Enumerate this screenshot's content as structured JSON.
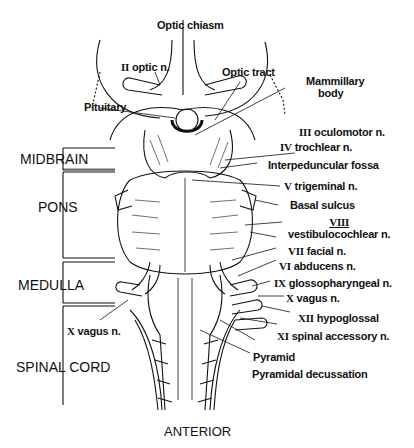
{
  "figure": {
    "orientation_label": "ANTERIOR",
    "regions": [
      {
        "id": "midbrain",
        "label": "MIDBRAIN"
      },
      {
        "id": "pons",
        "label": "PONS"
      },
      {
        "id": "medulla",
        "label": "MEDULLA"
      },
      {
        "id": "spinal_cord",
        "label": "SPINAL CORD"
      }
    ],
    "labels": {
      "optic_chiasm": "Optic chiasm",
      "optic_n": {
        "numeral": "II",
        "text": "optic n."
      },
      "optic_tract": "Optic tract",
      "mammillary_body_1": "Mammillary",
      "mammillary_body_2": "body",
      "pituitary": "Pituitary",
      "oculomotor": {
        "numeral": "III",
        "text": "oculomotor n."
      },
      "trochlear": {
        "numeral": "IV",
        "text": "trochlear n."
      },
      "interpeduncular_fossa": "Interpeduncular fossa",
      "trigeminal": {
        "numeral": "V",
        "text": "trigeminal n."
      },
      "basal_sulcus": "Basal sulcus",
      "vestibulocochlear": {
        "numeral": "VIII",
        "text": "vestibulocochlear n."
      },
      "facial": {
        "numeral": "VII",
        "text": "facial n."
      },
      "abducens": {
        "numeral": "VI",
        "text": "abducens n."
      },
      "glossopharyngeal": {
        "numeral": "IX",
        "text": "glossopharyngeal n."
      },
      "vagus_right": {
        "numeral": "X",
        "text": "vagus n."
      },
      "vagus_left": {
        "numeral": "X",
        "text": "vagus n."
      },
      "hypoglossal": {
        "numeral": "XII",
        "text": "hypoglossal"
      },
      "spinal_accessory": {
        "numeral": "XI",
        "text": "spinal accessory n."
      },
      "pyramid": "Pyramid",
      "pyramidal_decussation": "Pyramidal decussation"
    }
  }
}
